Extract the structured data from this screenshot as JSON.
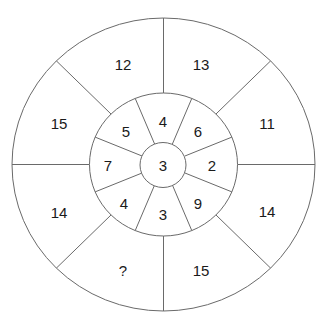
{
  "puzzle": {
    "center": {
      "value": "3"
    },
    "inner_ring": [
      {
        "position": "top",
        "value": "4"
      },
      {
        "position": "top-right",
        "value": "6"
      },
      {
        "position": "right",
        "value": "2"
      },
      {
        "position": "bottom-right",
        "value": "9"
      },
      {
        "position": "bottom",
        "value": "3"
      },
      {
        "position": "bottom-left",
        "value": "4"
      },
      {
        "position": "left",
        "value": "7"
      },
      {
        "position": "top-left",
        "value": "5"
      }
    ],
    "outer_ring": [
      {
        "position": "top-right",
        "value": "13"
      },
      {
        "position": "right-top",
        "value": "11"
      },
      {
        "position": "right-bottom",
        "value": "14"
      },
      {
        "position": "bottom-right",
        "value": "15"
      },
      {
        "position": "bottom-left",
        "value": "?"
      },
      {
        "position": "left-bottom",
        "value": "14"
      },
      {
        "position": "left-top",
        "value": "15"
      },
      {
        "position": "top-left",
        "value": "12"
      }
    ],
    "colors": {
      "line": "#6a6a6a",
      "text": "#1a1a1a",
      "background": "#ffffff"
    }
  }
}
